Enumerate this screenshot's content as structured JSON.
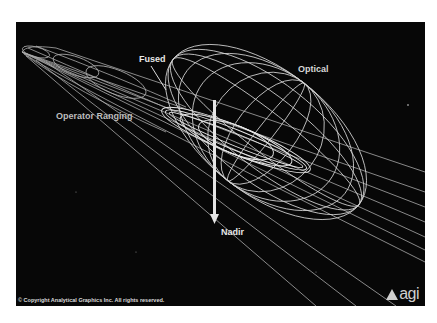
{
  "figure": {
    "labels": {
      "fused": "Fused",
      "optical": "Optical",
      "operator_ranging": "Operator Ranging",
      "nadir": "Nadir"
    },
    "copyright": "© Copyright Analytical Graphics Inc. All rights reserved.",
    "logo_text": "agi",
    "colors": {
      "background": "#070707",
      "wireframe": "#cfcfcf",
      "text": "#e8e8e8"
    }
  }
}
